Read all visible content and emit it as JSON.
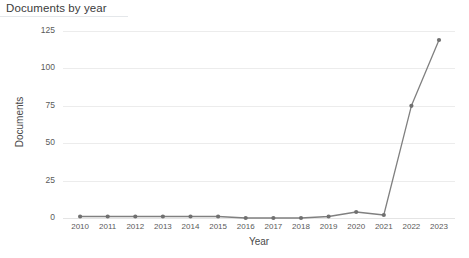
{
  "panel": {
    "title": "Documents by year"
  },
  "chart_data": {
    "type": "line",
    "title": "Documents by year",
    "xlabel": "Year",
    "ylabel": "Documents",
    "categories": [
      "2010",
      "2011",
      "2012",
      "2013",
      "2014",
      "2015",
      "2016",
      "2017",
      "2018",
      "2019",
      "2020",
      "2021",
      "2022",
      "2023"
    ],
    "values": [
      1,
      1,
      1,
      1,
      1,
      1,
      0,
      0,
      0,
      1,
      4,
      2,
      75,
      119
    ],
    "series": [
      {
        "name": "Documents",
        "values": [
          1,
          1,
          1,
          1,
          1,
          1,
          0,
          0,
          0,
          1,
          4,
          2,
          75,
          119
        ]
      }
    ],
    "xtick_labels": [
      "2010",
      "2011",
      "2012",
      "2013",
      "2014",
      "2015",
      "2016",
      "2017",
      "2018",
      "2019",
      "2020",
      "2021",
      "2022",
      "2023"
    ],
    "ytick_labels": [
      "0",
      "25",
      "50",
      "75",
      "100",
      "125"
    ],
    "ytick_values": [
      0,
      25,
      50,
      75,
      100,
      125
    ],
    "ylim": [
      0,
      125
    ],
    "grid": "horizontal",
    "legend": "none",
    "line_color": "#808080",
    "marker_color": "#707070",
    "grid_color": "#ececec",
    "background_color": "#ffffff"
  }
}
